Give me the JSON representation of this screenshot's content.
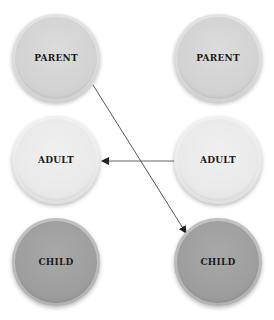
{
  "diagram": {
    "left_column": [
      {
        "label": "PARENT",
        "role": "parent",
        "color": "#d2d2d2",
        "cx": 56,
        "cy": 58
      },
      {
        "label": "ADULT",
        "role": "adult",
        "color": "#e9e9e9",
        "cx": 56,
        "cy": 160
      },
      {
        "label": "CHILD",
        "role": "child",
        "color": "#9e9e9e",
        "cx": 56,
        "cy": 262
      }
    ],
    "right_column": [
      {
        "label": "PARENT",
        "role": "parent",
        "color": "#d2d2d2",
        "cx": 218,
        "cy": 58
      },
      {
        "label": "ADULT",
        "role": "adult",
        "color": "#e9e9e9",
        "cx": 218,
        "cy": 160
      },
      {
        "label": "CHILD",
        "role": "child",
        "color": "#9e9e9e",
        "cx": 218,
        "cy": 262
      }
    ],
    "edges": [
      {
        "from": "left PARENT",
        "to": "right CHILD"
      },
      {
        "from": "right ADULT",
        "to": "left ADULT"
      }
    ],
    "line_color": "#333333"
  }
}
